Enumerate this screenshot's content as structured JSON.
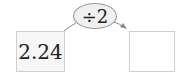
{
  "diagram": {
    "operation": "÷2",
    "input_value": "2.24",
    "output_value": "",
    "colors": {
      "box_border": "#cfcfcf",
      "input_fill": "#f6f6f6",
      "operator_fill": "#f0f0f0",
      "arrow": "#888888"
    }
  }
}
